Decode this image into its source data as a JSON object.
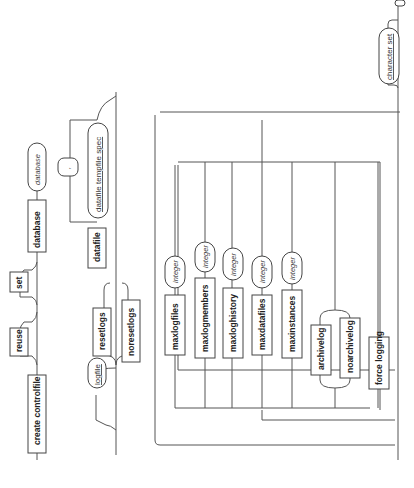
{
  "diagram": {
    "type": "railroad-syntax",
    "orientation": "rotated-90-clockwise",
    "row1": {
      "create": "create controlfile",
      "reuse": "reuse",
      "set": "set",
      "database": "database",
      "database_name": "database"
    },
    "row2": {
      "logfile": "logfile",
      "resetlogs": "resetlogs",
      "noresetlogs": "noresetlogs",
      "datafile": "datafile",
      "datafile_spec": "datafile tempfile spec",
      "separator": ","
    },
    "row3": {
      "options": [
        {
          "keyword": "maxlogfiles",
          "arg": "integer"
        },
        {
          "keyword": "maxlogmembers",
          "arg": "integer"
        },
        {
          "keyword": "maxloghistory",
          "arg": "integer"
        },
        {
          "keyword": "maxdatafiles",
          "arg": "integer"
        },
        {
          "keyword": "maxinstances",
          "arg": "integer"
        }
      ],
      "archivelog": "archivelog",
      "noarchivelog": "noarchivelog",
      "force_logging": "force logging"
    },
    "row4": {
      "character_set": "character set"
    }
  }
}
